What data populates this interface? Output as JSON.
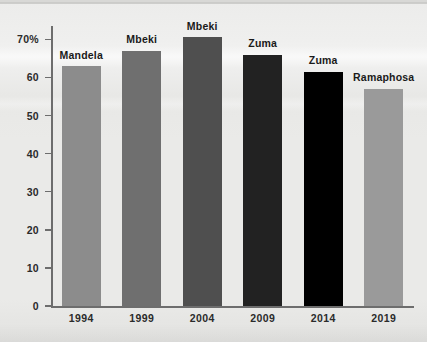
{
  "chart_data": {
    "type": "bar",
    "title": "",
    "subtitle": "",
    "xlabel": "",
    "ylabel": "",
    "ylim": [
      0,
      70
    ],
    "grid": false,
    "legend_position": "none",
    "categories": [
      "1994",
      "1999",
      "2004",
      "2009",
      "2014",
      "2019"
    ],
    "values": [
      63,
      67,
      70.5,
      66,
      61.5,
      57
    ],
    "point_labels": [
      "Mandela",
      "Mbeki",
      "Mbeki",
      "Zuma",
      "Zuma",
      "Ramaphosa"
    ],
    "bar_colors": [
      "#8c8c8c",
      "#6f6f6f",
      "#4f4f4f",
      "#222222",
      "#000000",
      "#9a9a9a"
    ],
    "y_ticks": [
      {
        "value": 70,
        "label": "70%"
      },
      {
        "value": 60,
        "label": "60"
      },
      {
        "value": 50,
        "label": "50"
      },
      {
        "value": 40,
        "label": "40"
      },
      {
        "value": 30,
        "label": "30"
      },
      {
        "value": 20,
        "label": "20"
      },
      {
        "value": 10,
        "label": "10"
      },
      {
        "value": 0,
        "label": "0"
      }
    ],
    "series": [
      {
        "name": "Voter turnout",
        "values": [
          63,
          67,
          70.5,
          66,
          61.5,
          57
        ]
      }
    ]
  },
  "colors": {
    "background": "#eaeae8",
    "axis": "#6d6d6d",
    "text": "#2b2b2b"
  }
}
